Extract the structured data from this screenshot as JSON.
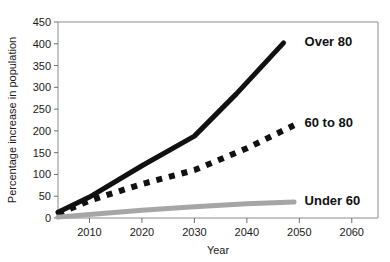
{
  "chart_data": {
    "type": "line",
    "title": "",
    "xlabel": "Year",
    "ylabel": "Percentage increase in population",
    "xlim": [
      2004,
      2065
    ],
    "ylim": [
      0,
      450
    ],
    "xticks": [
      "2010",
      "2020",
      "2030",
      "2040",
      "2050",
      "2060"
    ],
    "xtick_values": [
      2010,
      2020,
      2030,
      2040,
      2050,
      2060
    ],
    "yticks": [
      "0",
      "50",
      "100",
      "150",
      "200",
      "250",
      "300",
      "350",
      "400",
      "450"
    ],
    "ytick_values": [
      0,
      50,
      100,
      150,
      200,
      250,
      300,
      350,
      400,
      450
    ],
    "grid": false,
    "legend": "inline-end-of-line",
    "series": [
      {
        "name": "Over 80",
        "label": "Over 80",
        "color": "#111111",
        "style": "solid",
        "width": 5,
        "x": [
          2004,
          2010,
          2020,
          2030,
          2038,
          2047
        ],
        "values": [
          13,
          48,
          120,
          188,
          285,
          402
        ]
      },
      {
        "name": "60 to 80",
        "label": "60 to 80",
        "color": "#111111",
        "style": "dashed",
        "width": 6,
        "x": [
          2004,
          2010,
          2020,
          2030,
          2040,
          2049
        ],
        "values": [
          10,
          40,
          78,
          110,
          160,
          213
        ]
      },
      {
        "name": "Under 60",
        "label": "Under 60",
        "color": "#a6a6a6",
        "style": "solid",
        "width": 5,
        "x": [
          2004,
          2010,
          2020,
          2030,
          2040,
          2049
        ],
        "values": [
          2,
          8,
          18,
          26,
          33,
          37
        ]
      }
    ],
    "annotations": [
      {
        "text": "Over 80",
        "x": 2051,
        "y": 405
      },
      {
        "text": "60 to 80",
        "x": 2051,
        "y": 218
      },
      {
        "text": "Under 60",
        "x": 2051,
        "y": 40
      }
    ]
  }
}
